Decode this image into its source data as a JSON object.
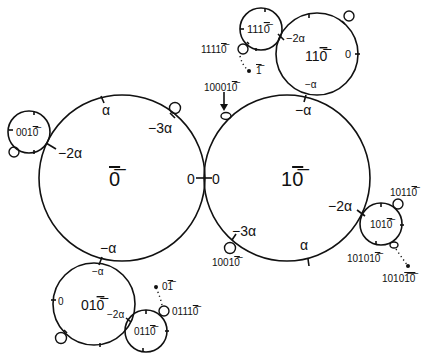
{
  "diagram": {
    "type": "circle-tangency-diagram",
    "circles": [
      {
        "id": "0bar",
        "label_main": "0",
        "label_overline": "0",
        "cx": 122,
        "cy": 178,
        "r": 83
      },
      {
        "id": "10bar",
        "label_plain": "1",
        "label_overline": "0",
        "cx": 287,
        "cy": 178,
        "r": 83
      },
      {
        "id": "110bar",
        "label_plain": "11",
        "label_overline": "0",
        "cx": 317,
        "cy": 54,
        "r": 41
      },
      {
        "id": "1110bar",
        "label_plain": "111",
        "label_overline": "0",
        "cx": 261,
        "cy": 29,
        "r": 21
      },
      {
        "id": "0010bar",
        "label_plain": "001",
        "label_overline": "0",
        "cx": 29,
        "cy": 132,
        "r": 21
      },
      {
        "id": "010bar",
        "label_plain": "01",
        "label_overline": "0",
        "cx": 94,
        "cy": 304,
        "r": 41
      },
      {
        "id": "0110bar",
        "label_plain": "011",
        "label_overline": "0",
        "cx": 146,
        "cy": 331,
        "r": 21
      },
      {
        "id": "1010bar",
        "label_plain": "101",
        "label_overline": "0",
        "cx": 381,
        "cy": 224,
        "r": 21
      }
    ],
    "angle_labels": {
      "big0": {
        "alpha": "α",
        "minus3alpha": "−3α",
        "minus2alpha": "−2α",
        "zero": "0",
        "minusalpha": "−α"
      },
      "big10": {
        "zero": "0",
        "minusalpha": "−α",
        "minus2alpha": "−2α",
        "minus3alpha": "−3α",
        "alpha": "α"
      },
      "c110": {
        "minus2alpha": "−2α",
        "zero": "0",
        "minusalpha": "−α"
      },
      "c010": {
        "minusalpha": "−α",
        "zero": "0",
        "minus2alpha": "−2α"
      }
    },
    "point_labels": {
      "p11110": {
        "plain": "1111",
        "overline": "0"
      },
      "pbar1": {
        "plain": "",
        "overline": "1"
      },
      "p100010": {
        "plain": "10001",
        "overline": "0"
      },
      "p10010": {
        "plain": "1001",
        "overline": "0"
      },
      "p10110": {
        "plain": "1011",
        "overline": "0"
      },
      "p101010": {
        "plain": "10101",
        "overline": "0"
      },
      "p1010_10": {
        "plain": "1010",
        "overline": "10"
      },
      "p01bar": {
        "plain": "0",
        "overline": "1"
      },
      "p01110": {
        "plain": "0111",
        "overline": "0"
      }
    }
  }
}
